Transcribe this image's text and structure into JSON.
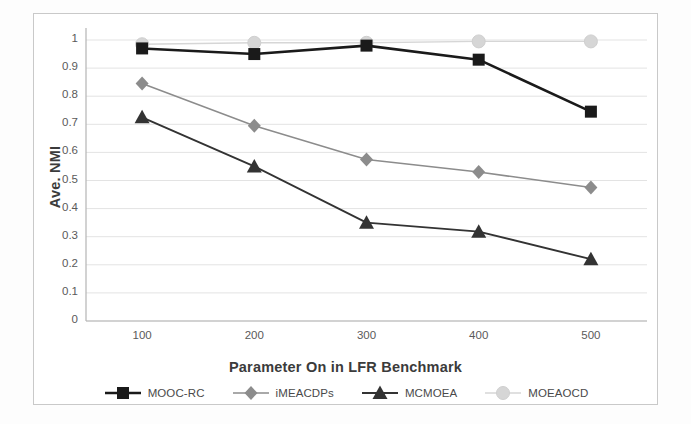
{
  "chart_data": {
    "type": "line",
    "title": "",
    "xlabel": "Parameter On in LFR Benchmark",
    "ylabel": "Ave. NMI",
    "x": [
      100,
      200,
      300,
      400,
      500
    ],
    "categories": [
      "100",
      "200",
      "300",
      "400",
      "500"
    ],
    "xlim": [
      50,
      550
    ],
    "ylim": [
      0,
      1
    ],
    "yticks": [
      "0",
      "0.1",
      "0.2",
      "0.3",
      "0.4",
      "0.5",
      "0.6",
      "0.7",
      "0.8",
      "0.9",
      "1"
    ],
    "ytick_values": [
      0,
      0.1,
      0.2,
      0.3,
      0.4,
      0.5,
      0.6,
      0.7,
      0.8,
      0.9,
      1
    ],
    "grid": true,
    "legend_position": "bottom",
    "series": [
      {
        "name": "MOOC-RC",
        "marker": "square",
        "color": "#1a1a1a",
        "line_width": 2.6,
        "values": [
          0.97,
          0.95,
          0.98,
          0.93,
          0.745
        ]
      },
      {
        "name": "iMEACDPs",
        "marker": "diamond",
        "color": "#8c8c8c",
        "line_width": 1.5,
        "values": [
          0.845,
          0.695,
          0.575,
          0.53,
          0.475
        ]
      },
      {
        "name": "MCMOEA",
        "marker": "triangle",
        "color": "#333333",
        "line_width": 1.9,
        "values": [
          0.725,
          0.55,
          0.35,
          0.318,
          0.22
        ]
      },
      {
        "name": "MOEAOCD",
        "marker": "circle",
        "color": "#d6d6d6",
        "line_width": 1.4,
        "values": [
          0.985,
          0.99,
          0.99,
          0.995,
          0.995
        ]
      }
    ]
  },
  "colors": {
    "grid": "#e3e3e3",
    "axis": "#b4b4b4",
    "tick_text": "#5a5a5a",
    "title_text": "#3b3b3b",
    "frame": "#c9c9c9",
    "background": "#ffffff"
  }
}
